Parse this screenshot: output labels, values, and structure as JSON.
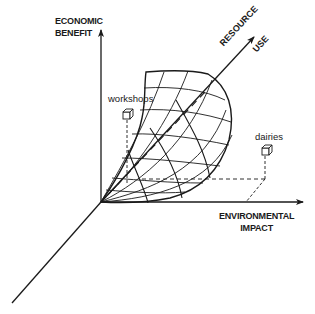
{
  "diagram": {
    "axes": {
      "y_axis": {
        "label_line1": "ECONOMIC",
        "label_line2": "BENEFIT"
      },
      "x_axis": {
        "label_line1": "ENVIRONMENTAL",
        "label_line2": "IMPACT"
      },
      "z_axis": {
        "label_line1": "RESOURCE",
        "label_line2": "USE"
      }
    },
    "points": [
      {
        "label": "workshops",
        "icon": "cube-icon"
      },
      {
        "label": "dairies",
        "icon": "cube-icon"
      }
    ],
    "colors": {
      "ink": "#1a1a1a",
      "background": "#ffffff"
    }
  }
}
